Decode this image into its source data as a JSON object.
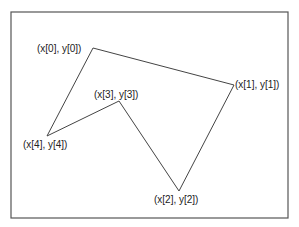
{
  "diagram": {
    "type": "polygon",
    "frame": {
      "x": 11,
      "y": 12,
      "width": 277,
      "height": 206,
      "stroke": "#555555"
    },
    "polygon": {
      "stroke": "#444444",
      "points": [
        {
          "x": 93,
          "y": 48,
          "label": "(x[0], y[0])"
        },
        {
          "x": 234,
          "y": 85,
          "label": "(x[1], y[1])"
        },
        {
          "x": 179,
          "y": 191,
          "label": "(x[2], y[2])"
        },
        {
          "x": 119,
          "y": 101,
          "label": "(x[3], y[3])"
        },
        {
          "x": 47,
          "y": 136,
          "label": "(x[4], y[4])"
        }
      ]
    }
  }
}
